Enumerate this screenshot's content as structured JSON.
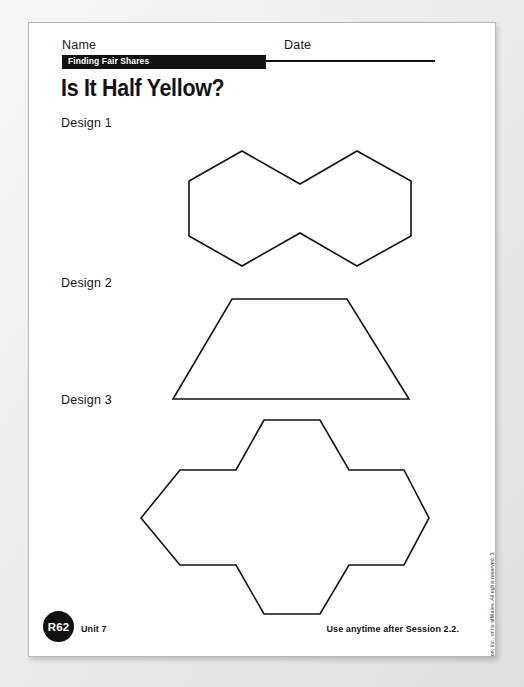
{
  "page": {
    "name_label": "Name",
    "date_label": "Date",
    "banner_text": "Finding Fair Shares",
    "title": "Is It Half Yellow?",
    "copyright": "Copyright © by Pearson Education, Inc., or its affiliates. All rights reserved. 3"
  },
  "designs": [
    {
      "label": "Design 1",
      "shape_name": "two-joined-hexagons",
      "points": "213,128 271,161 328,128 382,158 382,213 328,243 271,210 213,243 160,213 160,158"
    },
    {
      "label": "Design 2",
      "shape_name": "trapezoid",
      "points": "203,276 318,276 380,376 144,376"
    },
    {
      "label": "Design 3",
      "shape_name": "hexagon-cross",
      "points": "235,397 291,397 320,447 375,447 400,495 375,542 320,542 291,591 235,591 207,542 151,542 112,495 151,447 207,447"
    }
  ],
  "footer": {
    "page_code": "R62",
    "unit": "Unit 7",
    "session_note": "Use anytime after Session 2.2."
  }
}
